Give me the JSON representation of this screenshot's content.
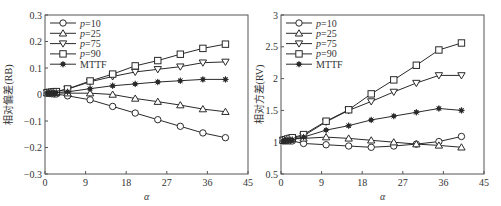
{
  "chart_data": [
    {
      "type": "line",
      "title": "",
      "xlabel": "α",
      "ylabel": "相对偏差(RB)",
      "xlim": [
        0,
        45
      ],
      "ylim": [
        -0.3,
        0.3
      ],
      "xticks": [
        0,
        9,
        18,
        27,
        36,
        45
      ],
      "yticks": [
        -0.3,
        -0.2,
        -0.1,
        0,
        0.1,
        0.2,
        0.3
      ],
      "ytick_labels": [
        "−0.3",
        "−0.2",
        "−0.1",
        "0",
        "0.1",
        "0.2",
        "0.3"
      ],
      "grid": false,
      "legend_position": "upper left",
      "x": [
        0.5,
        1,
        1.5,
        2,
        2.5,
        5,
        10,
        15,
        20,
        25,
        30,
        35,
        40
      ],
      "series": [
        {
          "name": "p=10",
          "marker": "circle",
          "values": [
            0.005,
            0.004,
            0.003,
            0.002,
            0.002,
            -0.005,
            -0.02,
            -0.045,
            -0.07,
            -0.095,
            -0.12,
            -0.145,
            -0.163
          ]
        },
        {
          "name": "p=25",
          "marker": "triangle-up",
          "values": [
            0.006,
            0.006,
            0.006,
            0.006,
            0.006,
            0.005,
            0.005,
            0.0,
            -0.015,
            -0.027,
            -0.04,
            -0.055,
            -0.065
          ]
        },
        {
          "name": "p=75",
          "marker": "triangle-down",
          "values": [
            0.007,
            0.008,
            0.009,
            0.01,
            0.011,
            0.02,
            0.048,
            0.068,
            0.085,
            0.095,
            0.105,
            0.12,
            0.123
          ]
        },
        {
          "name": "p=90",
          "marker": "square",
          "values": [
            0.007,
            0.008,
            0.009,
            0.01,
            0.011,
            0.021,
            0.051,
            0.077,
            0.108,
            0.128,
            0.152,
            0.174,
            0.19
          ]
        },
        {
          "name": "MTTF",
          "marker": "star",
          "values": [
            0.006,
            0.006,
            0.007,
            0.007,
            0.008,
            0.01,
            0.022,
            0.033,
            0.04,
            0.047,
            0.052,
            0.057,
            0.057
          ]
        }
      ]
    },
    {
      "type": "line",
      "title": "",
      "xlabel": "α",
      "ylabel": "相对方差(RV)",
      "xlim": [
        0,
        45
      ],
      "ylim": [
        0.5,
        3
      ],
      "xticks": [
        0,
        9,
        18,
        27,
        36,
        45
      ],
      "yticks": [
        0.5,
        1,
        1.5,
        2,
        2.5,
        3
      ],
      "ytick_labels": [
        "0.5",
        "1",
        "1.5",
        "2",
        "2.5",
        "3"
      ],
      "grid": false,
      "legend_position": "upper left",
      "x": [
        0.5,
        1,
        1.5,
        2,
        2.5,
        5,
        10,
        15,
        20,
        25,
        30,
        35,
        40
      ],
      "series": [
        {
          "name": "p=10",
          "marker": "circle",
          "values": [
            1.02,
            1.02,
            1.02,
            1.02,
            1.02,
            0.98,
            0.96,
            0.94,
            0.92,
            0.94,
            0.97,
            1.01,
            1.09
          ]
        },
        {
          "name": "p=25",
          "marker": "triangle-up",
          "values": [
            1.03,
            1.03,
            1.04,
            1.04,
            1.05,
            1.06,
            1.08,
            1.06,
            1.03,
            1.0,
            0.97,
            0.95,
            0.92
          ]
        },
        {
          "name": "p=75",
          "marker": "triangle-down",
          "values": [
            1.03,
            1.04,
            1.05,
            1.05,
            1.06,
            1.1,
            1.32,
            1.5,
            1.64,
            1.79,
            1.93,
            2.05,
            2.05
          ]
        },
        {
          "name": "p=90",
          "marker": "square",
          "values": [
            1.03,
            1.04,
            1.05,
            1.06,
            1.07,
            1.12,
            1.33,
            1.51,
            1.76,
            1.98,
            2.21,
            2.45,
            2.56
          ]
        },
        {
          "name": "MTTF",
          "marker": "star",
          "values": [
            1.02,
            1.03,
            1.03,
            1.04,
            1.04,
            1.08,
            1.19,
            1.26,
            1.35,
            1.41,
            1.47,
            1.53,
            1.5
          ]
        }
      ]
    }
  ]
}
